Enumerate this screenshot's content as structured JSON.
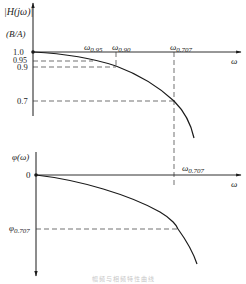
{
  "diagram": {
    "type": "frequency-response",
    "magnitude_plot": {
      "y_axis_label": "|H(jω)|",
      "y_axis_unit": "(B/A)",
      "x_axis_label": "ω",
      "y_ticks": [
        "1.0",
        "0.95",
        "0.9",
        "0.7"
      ],
      "x_markers": [
        {
          "base": "ω",
          "sub": "0.95"
        },
        {
          "base": "ω",
          "sub": "0.90"
        },
        {
          "base": "ω",
          "sub": "0.707"
        }
      ]
    },
    "phase_plot": {
      "y_axis_label": "φ(ω)",
      "x_axis_label": "ω",
      "origin_label": "0",
      "y_marker": {
        "base": "φ",
        "sub": "0.707"
      },
      "x_marker": {
        "base": "ω",
        "sub": "0.707"
      }
    },
    "caption": "幅频与相频特性曲线"
  },
  "colors": {
    "line": "#1a1a1a",
    "dashed": "#333333",
    "background": "#ffffff"
  }
}
